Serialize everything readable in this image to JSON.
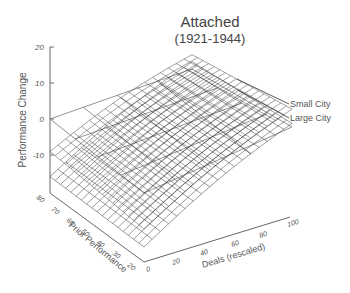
{
  "chart_data": {
    "type": "surface3d",
    "title": "Attached",
    "subtitle": "(1921-1944)",
    "zlabel": "Performance Change",
    "xlabel": "Deals (rescaled)",
    "ylabel": "Prior Performance",
    "z_ticks": [
      "20",
      "10",
      "0",
      "-10"
    ],
    "zlim": [
      -20,
      20
    ],
    "x_ticks": [
      "0",
      "20",
      "40",
      "60",
      "80",
      "100"
    ],
    "xlim": [
      0,
      100
    ],
    "y_ticks": [
      "80",
      "70",
      "60",
      "50",
      "40",
      "30",
      "20"
    ],
    "ylim": [
      20,
      80
    ],
    "series": [
      {
        "name": "Small City",
        "corners": {
          "deals0_prior80": -9,
          "deals0_prior20": -10,
          "deals100_prior80": 4,
          "deals100_prior20": 5
        }
      },
      {
        "name": "Large City",
        "corners": {
          "deals0_prior80": -16,
          "deals0_prior20": -15,
          "deals100_prior80": 2,
          "deals100_prior20": 1
        }
      }
    ],
    "legend": [
      "Small City",
      "Large City"
    ],
    "grid": "zero-plane reference grid"
  }
}
